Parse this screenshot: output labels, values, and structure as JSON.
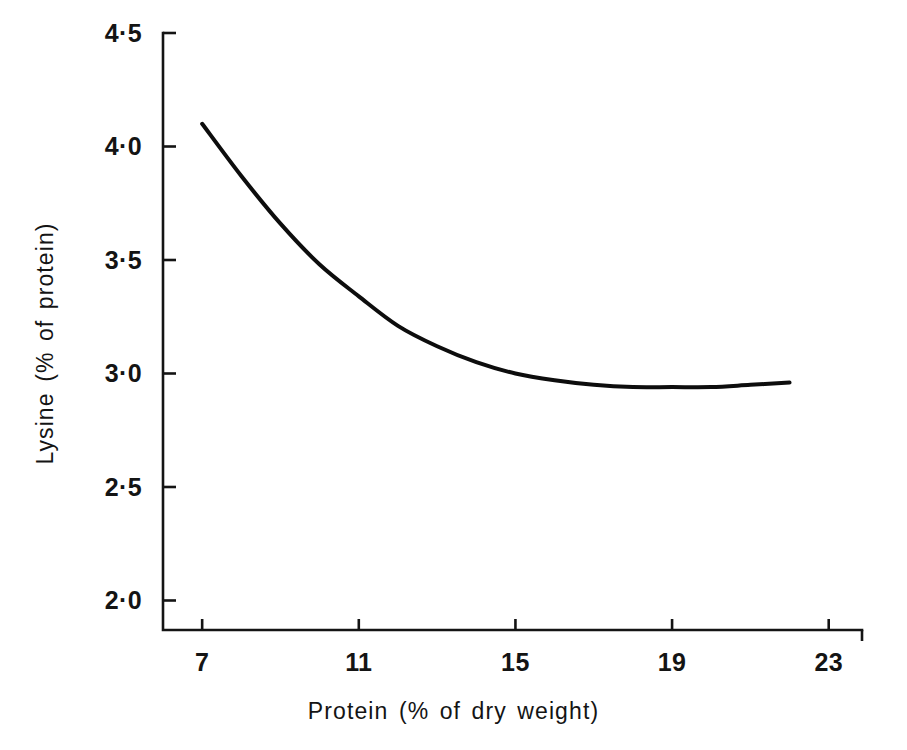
{
  "chart_data": {
    "type": "line",
    "title": "",
    "xlabel": "Protein (% of dry weight)",
    "ylabel": "Lysine (% of protein)",
    "xlim": [
      6.0,
      23.85
    ],
    "ylim": [
      1.87,
      4.5
    ],
    "xticks": [
      7,
      11,
      15,
      19,
      23
    ],
    "xtick_labels": [
      "7",
      "11",
      "15",
      "19",
      "23"
    ],
    "yticks": [
      2.0,
      2.5,
      3.0,
      3.5,
      4.0,
      4.5
    ],
    "ytick_labels": [
      "2·0",
      "2·5",
      "3·0",
      "3·5",
      "4·0",
      "4·5"
    ],
    "grid": false,
    "legend": "none",
    "series": [
      {
        "name": "Lysine vs protein",
        "color": "#0d0d0d",
        "line_width": 4,
        "x": [
          7.0,
          8.0,
          9.0,
          10.0,
          11.0,
          12.0,
          13.0,
          14.0,
          15.0,
          16.0,
          17.0,
          18.0,
          19.0,
          20.0,
          21.0,
          22.0
        ],
        "y": [
          4.1,
          3.87,
          3.66,
          3.48,
          3.34,
          3.21,
          3.12,
          3.05,
          3.0,
          2.97,
          2.95,
          2.94,
          2.94,
          2.94,
          2.95,
          2.96
        ]
      }
    ],
    "annotations": []
  },
  "axes": {
    "y_axis_name": "y-axis-spine",
    "x_axis_name": "x-axis-spine",
    "tick_direction": "in",
    "spine_color": "#141414"
  }
}
